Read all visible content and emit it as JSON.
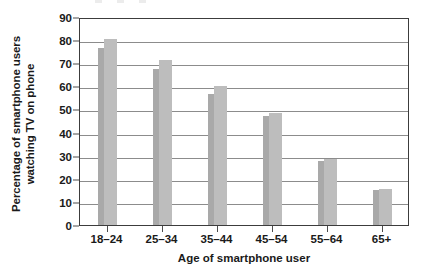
{
  "chart_data": {
    "type": "bar",
    "title": "",
    "xlabel": "Age of smartphone user",
    "ylabel_lines": [
      "Percentage of smartphone users",
      "watching TV on phone"
    ],
    "ylabel": "Percentage of smartphone users watching TV on phone",
    "categories": [
      "18–24",
      "25–34",
      "35–44",
      "45–54",
      "55–64",
      "65+"
    ],
    "ylim": [
      0,
      90
    ],
    "yticks": [
      0,
      10,
      20,
      30,
      40,
      50,
      60,
      70,
      80,
      90
    ],
    "grid": true,
    "legend": "none",
    "series": [
      {
        "name": "narrow-bar",
        "color": "#a9a9a9",
        "values": [
          76.5,
          67.5,
          56.5,
          47.0,
          27.5,
          15.0
        ]
      },
      {
        "name": "wide-bar",
        "color": "#bdbdbd",
        "values": [
          80.5,
          71.5,
          60.0,
          48.5,
          28.5,
          15.5
        ]
      }
    ]
  },
  "colors": {
    "bar_narrow": "#a9a9a9",
    "bar_wide": "#bdbdbd",
    "gridline": "#8c8c8c",
    "frame": "#3c3c3c",
    "text": "#1a1a1a",
    "background": "#ffffff"
  }
}
